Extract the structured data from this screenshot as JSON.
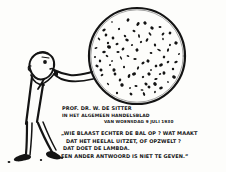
{
  "artwork": {
    "title": "Cartoon of an expanding universe balloon",
    "medium": "pen-and-ink newspaper cartoon",
    "background_color": "#fdfdfb",
    "ink_color": "#141414"
  },
  "figure": {
    "name": "man-blowing-balloon",
    "parts": [
      "head",
      "eye",
      "torso",
      "arm",
      "leg-left",
      "leg-right",
      "shoe-left",
      "shoe-right"
    ]
  },
  "balloon": {
    "name": "universe-balloon",
    "description": "large circle speckled with dots representing nebulae",
    "dot_count": 86,
    "center_x": 137,
    "center_y": 56,
    "radius": 48
  },
  "caption": {
    "line1": "PROF. DR. W. DE SITTER",
    "line2": "IN HET ALGEMEEN HANDELSBLAD",
    "line3": "VAN WOENSDAG 9 JULI 1930"
  },
  "quote": {
    "line1": "„WIE BLAAST ECHTER DE BAL OP ? WAT MAAKT",
    "line2": "DAT HET HEELAL UITZET, OF OPZWELT ?",
    "line3": "DAT DOET DE LAMBDA.",
    "line4": "EEN ANDER ANTWOORD IS NIET TE GEVEN.”"
  },
  "dots": [
    [
      112,
      22
    ],
    [
      128,
      20
    ],
    [
      145,
      23
    ],
    [
      160,
      27
    ],
    [
      170,
      33
    ],
    [
      104,
      30
    ],
    [
      119,
      29
    ],
    [
      134,
      31
    ],
    [
      150,
      34
    ],
    [
      163,
      39
    ],
    [
      176,
      43
    ],
    [
      99,
      39
    ],
    [
      113,
      38
    ],
    [
      127,
      40
    ],
    [
      141,
      42
    ],
    [
      155,
      45
    ],
    [
      168,
      50
    ],
    [
      179,
      54
    ],
    [
      96,
      48
    ],
    [
      109,
      47
    ],
    [
      123,
      49
    ],
    [
      137,
      50
    ],
    [
      151,
      53
    ],
    [
      164,
      57
    ],
    [
      176,
      62
    ],
    [
      95,
      57
    ],
    [
      107,
      56
    ],
    [
      121,
      58
    ],
    [
      135,
      59
    ],
    [
      148,
      61
    ],
    [
      161,
      65
    ],
    [
      173,
      69
    ],
    [
      97,
      66
    ],
    [
      110,
      65
    ],
    [
      124,
      67
    ],
    [
      138,
      68
    ],
    [
      151,
      70
    ],
    [
      164,
      73
    ],
    [
      174,
      77
    ],
    [
      102,
      75
    ],
    [
      115,
      74
    ],
    [
      129,
      76
    ],
    [
      143,
      77
    ],
    [
      156,
      79
    ],
    [
      168,
      82
    ],
    [
      108,
      84
    ],
    [
      122,
      85
    ],
    [
      136,
      86
    ],
    [
      149,
      87
    ],
    [
      161,
      88
    ],
    [
      117,
      93
    ],
    [
      131,
      94
    ],
    [
      144,
      94
    ],
    [
      155,
      92
    ],
    [
      126,
      100
    ],
    [
      139,
      100
    ],
    [
      106,
      35
    ],
    [
      152,
      28
    ],
    [
      168,
      62
    ],
    [
      100,
      61
    ],
    [
      147,
      40
    ],
    [
      132,
      45
    ],
    [
      118,
      52
    ],
    [
      159,
      50
    ],
    [
      143,
      63
    ],
    [
      114,
      70
    ],
    [
      128,
      56
    ],
    [
      156,
      66
    ],
    [
      104,
      52
    ],
    [
      170,
      45
    ],
    [
      125,
      36
    ],
    [
      139,
      36
    ],
    [
      112,
      61
    ],
    [
      149,
      74
    ],
    [
      134,
      74
    ],
    [
      120,
      80
    ],
    [
      146,
      84
    ],
    [
      160,
      74
    ],
    [
      108,
      43
    ],
    [
      163,
      34
    ],
    [
      130,
      88
    ],
    [
      142,
      90
    ],
    [
      155,
      84
    ],
    [
      117,
      44
    ],
    [
      101,
      70
    ],
    [
      138,
      24
    ]
  ]
}
